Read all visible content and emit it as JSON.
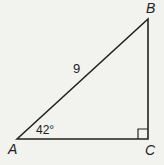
{
  "diagram": {
    "type": "right-triangle",
    "vertices": {
      "A": {
        "label": "A"
      },
      "B": {
        "label": "B"
      },
      "C": {
        "label": "C"
      }
    },
    "hypotenuse_label": "9",
    "angle_A_label": "42°",
    "right_angle_at": "C",
    "colors": {
      "line": "#222222",
      "background": "#f2f2ee"
    }
  }
}
